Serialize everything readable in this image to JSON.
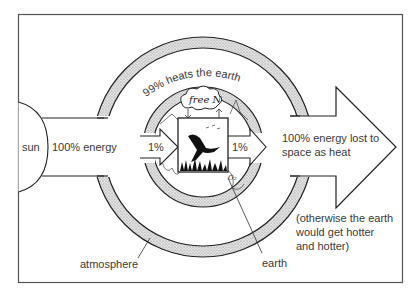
{
  "diagram": {
    "labels": {
      "sun": "sun",
      "incoming_energy": "100% energy",
      "heats_earth": "99% heats the earth",
      "to_life_in": "1%",
      "to_life_out": "1%",
      "free_n": "free N",
      "outgoing_line1": "100% energy lost to",
      "outgoing_line2": "space as heat",
      "note_line1": "(otherwise the earth",
      "note_line2": "would get hotter",
      "note_line3": "and hotter)",
      "atmosphere": "atmosphere",
      "earth": "earth",
      "o2": "O₂"
    },
    "nodes": [
      "sun",
      "atmosphere",
      "earth",
      "living organisms",
      "space"
    ],
    "edges": [
      {
        "from": "sun",
        "to": "earth",
        "label": "100% energy"
      },
      {
        "from": "sun",
        "to": "earth",
        "label": "99% heats the earth"
      },
      {
        "from": "energy",
        "to": "living organisms",
        "label": "1%"
      },
      {
        "from": "living organisms",
        "to": "space",
        "label": "1%"
      },
      {
        "from": "earth",
        "to": "space",
        "label": "100% energy lost to space as heat"
      }
    ],
    "colors": {
      "line": "#222222",
      "ring_fill": "#cfcfcf",
      "frame": "#555555",
      "text": "#3a3a3a"
    }
  }
}
